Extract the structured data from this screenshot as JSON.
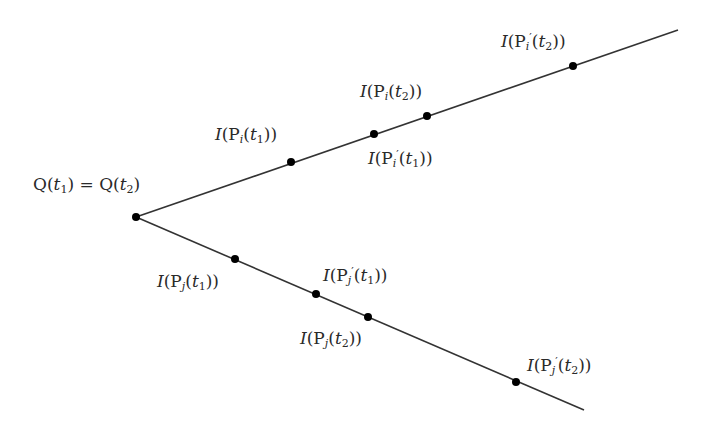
{
  "diagram": {
    "type": "branching-rays",
    "origin": {
      "x": 136,
      "y": 217,
      "label": "Q(t1) = Q(t2)"
    },
    "rays": [
      {
        "name": "upper",
        "end": {
          "x": 678,
          "y": 30
        },
        "points": [
          {
            "x": 291,
            "y": 162,
            "label": "I(Pi(t1))"
          },
          {
            "x": 374,
            "y": 134,
            "label": "I(Pi'(t1))"
          },
          {
            "x": 427,
            "y": 116,
            "label": "I(Pi(t2))"
          },
          {
            "x": 573,
            "y": 66,
            "label": "I(Pi'(t2))"
          }
        ]
      },
      {
        "name": "lower",
        "end": {
          "x": 584,
          "y": 410
        },
        "points": [
          {
            "x": 235,
            "y": 259,
            "label": "I(Pj(t1))"
          },
          {
            "x": 316,
            "y": 294,
            "label": "I(Pj'(t1))"
          },
          {
            "x": 368,
            "y": 317,
            "label": "I(Pj(t2))"
          },
          {
            "x": 516,
            "y": 382,
            "label": "I(Pj'(t2))"
          }
        ]
      }
    ],
    "colors": {
      "line": "#333333",
      "point": "#000000",
      "text": "#2a2a2a",
      "background": "#ffffff"
    }
  },
  "labels": {
    "origin": {
      "Q": "Q",
      "t": "t",
      "sub1": "1",
      "eq": " = ",
      "sub2": "2"
    },
    "fn": "I",
    "P": "P",
    "t": "t",
    "prime": "′",
    "i": "i",
    "j": "j",
    "one": "1",
    "two": "2"
  }
}
